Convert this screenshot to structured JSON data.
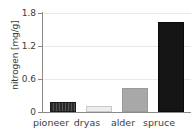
{
  "chart_data": {
    "type": "bar",
    "title": "",
    "xlabel": "",
    "ylabel": "nitrogen [mg/g]",
    "categories": [
      "pioneer",
      "dryas",
      "alder",
      "spruce"
    ],
    "values": [
      0.19,
      0.11,
      0.43,
      1.64
    ],
    "ylim": [
      0,
      1.8
    ],
    "yticks": [
      "0",
      "0.6",
      "1.2",
      "1.8"
    ],
    "ytick_values": [
      0,
      0.6,
      1.2,
      1.8
    ],
    "grid": "horizontal",
    "legend": "none",
    "bar_colors": [
      "#2b2b2b",
      "#ededed",
      "#a8a8a8",
      "#141414"
    ],
    "bar_patterns": [
      "vertical-hatch",
      "solid",
      "solid",
      "solid"
    ],
    "axis_color": "#8a8a8a",
    "grid_color": "#e9e9e9",
    "text_color": "#3c3c3c",
    "background": "#ffffff"
  }
}
